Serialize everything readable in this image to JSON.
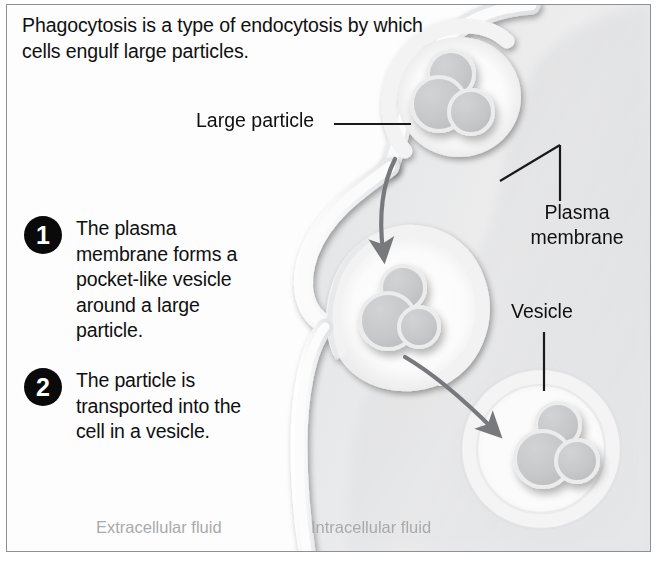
{
  "figure": {
    "title": "Phagocytosis is a type of endocytosis by which cells engulf large particles.",
    "topic": "phagocytosis"
  },
  "callouts": {
    "large_particle": "Large particle",
    "plasma_membrane_line1": "Plasma",
    "plasma_membrane_line2": "membrane",
    "vesicle": "Vesicle"
  },
  "steps": [
    {
      "number": "1",
      "text": "The plasma membrane forms a pocket-like vesicle around a large particle."
    },
    {
      "number": "2",
      "text": "The particle is transported into the cell in a vesicle."
    }
  ],
  "regions": {
    "extracellular": "Extracellular fluid",
    "intracellular": "Intracellular fluid"
  },
  "colors": {
    "background": "#ffffff",
    "frame_border": "#8d9196",
    "cytoplasm": "#e9e9ea",
    "cytoplasm_shadow": "#c2c3c5",
    "membrane": "#f4f4f4",
    "membrane_edge": "#d8d9db",
    "particle_fill": "#c6c7c8",
    "particle_outline": "#eceded",
    "arrow": "#77797c",
    "leader_line": "#1a1a1a",
    "text": "#101010",
    "badge": "#0a0a0a",
    "badge_text": "#ffffff",
    "fluid_label": "#a9aaac"
  },
  "graphics": {
    "arrow_1_name": "engulfment-arrow",
    "arrow_2_name": "transport-arrow",
    "particle_cluster_count": 3,
    "stage_names": [
      "particle-at-surface",
      "particle-in-pocket",
      "particle-in-vesicle"
    ]
  }
}
